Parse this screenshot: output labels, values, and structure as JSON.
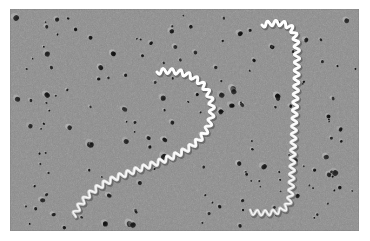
{
  "figure": {
    "kind": "electron-micrograph",
    "modality": "transmission electron microscopy, metal-shadowed replica",
    "color_mode": "grayscale",
    "background_color": "#8b8b8b",
    "filament_color": "#f2f2f2",
    "pore_color": "#1d1d1d",
    "frame_color": "#ffffff",
    "substrate": "porous membrane filter",
    "specimen_label": "spirochete bacteria",
    "organism_count": 2
  },
  "canvas": {
    "width": 370,
    "height": 241,
    "image_left": 10,
    "image_top": 9,
    "image_width": 349,
    "image_height": 222
  },
  "organisms": [
    {
      "id": "spirochete-left",
      "description": "hook-shaped helical filament, free end upper-left, curving right then down and left",
      "wave_amplitude": 2.6,
      "wave_period": 8.5,
      "stroke_width": 3.0,
      "path": "M147,63 C163,60 180,64 191,74 C202,85 204,100 200,113 C195,129 181,139 166,146 C148,154 128,160 110,167 C95,173 82,181 74,191 C68,198 66,203 64,207"
    },
    {
      "id": "spirochete-right",
      "description": "long vertical helical filament with hooked ends, top hook bends left, bottom hook bends left",
      "wave_amplitude": 2.6,
      "wave_period": 8.0,
      "stroke_width": 3.0,
      "path": "M252,16 C264,13 275,13 281,19 C286,25 287,36 287,48 C287,70 285,95 284,120 C283,143 282,165 281,182 C280,192 278,198 272,201 C262,205 250,204 240,203"
    }
  ],
  "pores": {
    "count_visible": 168,
    "diameter_range_px": [
      2,
      6
    ],
    "distribution": "random scatter across entire field"
  },
  "chart_data": null
}
